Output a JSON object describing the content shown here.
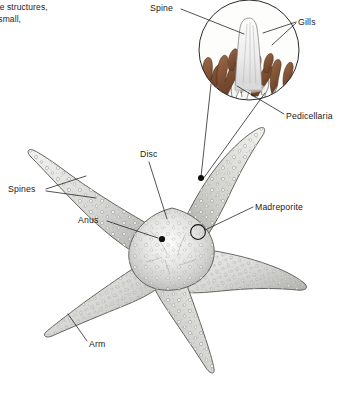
{
  "figure": {
    "background_color": "#ffffff",
    "line_color": "#1a1a1a",
    "gill_color": "#8b5a3c",
    "body_color": "#d8d8d6"
  },
  "caption": {
    "line1": "icate structures,",
    "line2": "e small,"
  },
  "labels": {
    "spine": "Spine",
    "gills": "Gills",
    "pedicellaria": "Pedicellaria",
    "disc": "Disc",
    "spines": "Spines",
    "anus": "Anus",
    "madreporite": "Madreporite",
    "arm": "Arm"
  },
  "inset": {
    "name": "magnified-spine-inset",
    "shape": "circle",
    "center_x": 249,
    "center_y": 50,
    "radius": 50,
    "contents": [
      "spine",
      "gills",
      "pedicellaria"
    ]
  },
  "organism": {
    "name": "sea star",
    "arm_count": 5,
    "center_x": 172,
    "center_y": 242
  }
}
